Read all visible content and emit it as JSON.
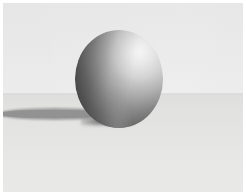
{
  "image": {
    "kind": "rendered-3d-scene",
    "subject": "sphere",
    "style": "grayscale diffuse render",
    "caption": "",
    "width_px": 246,
    "height_px": 195,
    "border": {
      "name": "white-photo-margin",
      "color": "#ffffff",
      "thickness_px": 3
    }
  },
  "scene": {
    "backdrop": {
      "name": "sky-backdrop",
      "color": "#e9e9e9",
      "top_color": "#e6e6e6",
      "bottom_color": "#ececec"
    },
    "ground": {
      "name": "ground-plane",
      "color": "#e2e2e1",
      "near_color": "#e8e8e7",
      "far_color": "#dededd",
      "horizon_y_px": 94
    },
    "sphere": {
      "name": "sphere",
      "center_x_px": 119,
      "center_y_px": 74,
      "diameter_px": 88,
      "highlight_color": "#f2f2f2",
      "midtone_color": "#9a9a9a",
      "shadow_color": "#454545",
      "highlight_position": "upper-right",
      "light_direction": "upper-right"
    },
    "shadow": {
      "name": "cast-shadow",
      "color": "#9a9a9a",
      "core_color": "#919191",
      "direction": "left",
      "length_px": 116,
      "thickness_px": 12,
      "top_y_px": 108
    }
  }
}
